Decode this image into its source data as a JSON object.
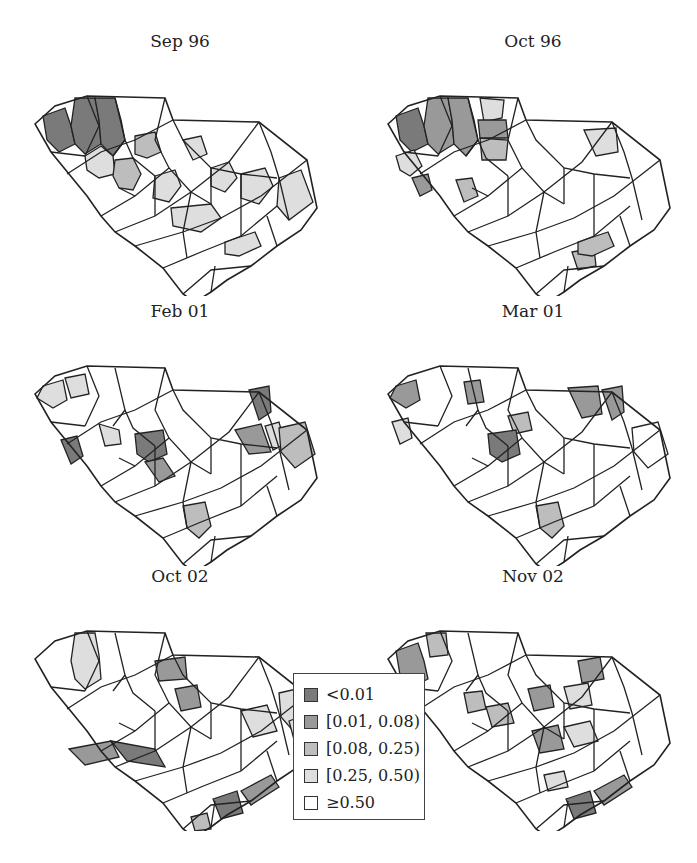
{
  "figure": {
    "panels": [
      {
        "title": "Sep 96",
        "fills": {
          "c1": 0,
          "c2": 0,
          "c3": 0,
          "c4": 3,
          "c5": 2,
          "c6": 3,
          "c7": 3,
          "c8": 3,
          "c9": 3,
          "c10": 3,
          "c11": 3,
          "c12": 3,
          "c13": 2
        }
      },
      {
        "title": "Oct 96",
        "fills": {
          "c1": 0,
          "c2": 1,
          "c3": 1,
          "c14": 3,
          "c15": 3,
          "c16": 1,
          "c17": 2,
          "c18": 3,
          "c19": 1,
          "c20": 2,
          "c21": 2,
          "c12": 2
        }
      },
      {
        "title": "Feb 01",
        "fills": {
          "c22": 3,
          "c23": 3,
          "c24": 0,
          "c25": 3,
          "c26": 0,
          "c27": 1,
          "c28": 0,
          "c29": 1,
          "c30": 3,
          "c31": 2,
          "c32": 2
        }
      },
      {
        "title": "Mar 01",
        "fills": {
          "c22": 1,
          "c33": 3,
          "c34": 1,
          "c35": 2,
          "c28": 1,
          "c36": 1,
          "c26": 0,
          "c31": 4,
          "c32": 2
        }
      },
      {
        "title": "Oct 02",
        "fills": {
          "c2": 3,
          "c37": 1,
          "c38": 1,
          "c39": 1,
          "c40": 0,
          "c41": 3,
          "c31": 3,
          "c42": 0,
          "c43": 1,
          "c44": 2,
          "c45": 3
        }
      },
      {
        "title": "Nov 02",
        "fills": {
          "c1": 1,
          "c46": 2,
          "c47": 2,
          "c38": 1,
          "c48": 2,
          "c49": 3,
          "c50": 1,
          "c51": 1,
          "c52": 3,
          "c42": 0,
          "c43": 1,
          "c53": 3
        }
      }
    ]
  },
  "legend": {
    "items": [
      {
        "label": "<0.01",
        "color": "#7a7a7a"
      },
      {
        "label": "[0.01, 0.08)",
        "color": "#999999"
      },
      {
        "label": "[0.08, 0.25)",
        "color": "#bdbdbd"
      },
      {
        "label": "[0.25, 0.50)",
        "color": "#dedede"
      },
      {
        "label": "≥0.50",
        "color": "#ffffff"
      }
    ]
  },
  "chart_data": {
    "type": "choropleth",
    "title": "",
    "region": "South Carolina counties",
    "panels": [
      "Sep 96",
      "Oct 96",
      "Feb 01",
      "Mar 01",
      "Oct 02",
      "Nov 02"
    ],
    "legend": [
      "<0.01",
      "[0.01, 0.08)",
      "[0.08, 0.25)",
      "[0.25, 0.50)",
      "≥0.50"
    ],
    "legend_position": "bottom-center"
  }
}
